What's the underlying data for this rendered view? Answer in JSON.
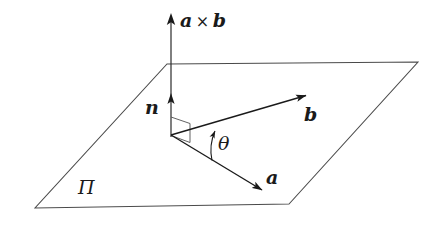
{
  "figure": {
    "background_color": "#ffffff",
    "line_color": "#3a3a3a",
    "vector_color": "#1a1a1a",
    "label_color": "#1a1a1a",
    "width": 447,
    "height": 229
  },
  "labels": {
    "cross_product_vector": "a",
    "cross_product_operator": "×",
    "cross_product_operand": "b",
    "normal_vector": "n",
    "vector_b": "b",
    "vector_a": "a",
    "angle": "θ",
    "plane": "Π"
  },
  "geometry": {
    "origin": {
      "x": 171,
      "y": 135
    },
    "plane_polygon": [
      {
        "x": 167,
        "y": 64
      },
      {
        "x": 418,
        "y": 62
      },
      {
        "x": 289,
        "y": 204
      },
      {
        "x": 35,
        "y": 208
      }
    ],
    "axis_cross_product": {
      "x1": 171,
      "y1": 135,
      "x2": 171,
      "y2": 14
    },
    "vector_normal": {
      "x1": 171,
      "y1": 135,
      "x2": 171,
      "y2": 94
    },
    "vector_b": {
      "x1": 171,
      "y1": 135,
      "x2": 310,
      "y2": 94
    },
    "vector_a": {
      "x1": 171,
      "y1": 135,
      "x2": 266,
      "y2": 193
    },
    "right_angle_marker": [
      {
        "x": 171,
        "y": 117
      },
      {
        "x": 190,
        "y": 123
      },
      {
        "x": 190,
        "y": 142
      },
      {
        "x": 171,
        "y": 135
      }
    ],
    "angle_arc": {
      "radius": 48,
      "start_angle_deg": -31,
      "end_angle_deg": 16,
      "arrow_at": "end"
    }
  }
}
